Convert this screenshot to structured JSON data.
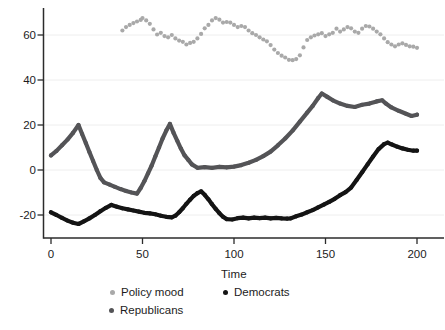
{
  "figure": {
    "background": "#ffffff",
    "text_color": "#1c1c1c",
    "axis_color": "#2b2b2b",
    "gridline_color": "#eeeeee"
  },
  "chart_data": {
    "type": "scatter",
    "title": "",
    "xlabel": "Time",
    "ylabel": "",
    "x_ticks": [
      0,
      50,
      100,
      150,
      200
    ],
    "y_ticks": [
      60,
      40,
      20,
      0,
      -20
    ],
    "xlim": [
      0,
      215
    ],
    "ylim": [
      -30,
      72
    ],
    "grid": "faint horizontal lines at each y tick",
    "legend_position": "bottom",
    "legend": [
      {
        "label": "Policy mood",
        "color": "#a9a9a9"
      },
      {
        "label": "Democrats",
        "color": "#141414"
      },
      {
        "label": "Republicans",
        "color": "#545457"
      }
    ],
    "series": [
      {
        "name": "Policy mood",
        "color": "#a9a9a9",
        "style": "dots",
        "points": [
          [
            39,
            62
          ],
          [
            41,
            63.5
          ],
          [
            43,
            64.5
          ],
          [
            45,
            65.3
          ],
          [
            47,
            66
          ],
          [
            49,
            66.7
          ],
          [
            50,
            67.5
          ],
          [
            52,
            66.5
          ],
          [
            54,
            65
          ],
          [
            56,
            62.5
          ],
          [
            58,
            60.2
          ],
          [
            60,
            61
          ],
          [
            62,
            59.5
          ],
          [
            64,
            59
          ],
          [
            66,
            60
          ],
          [
            68,
            58.5
          ],
          [
            70,
            57.5
          ],
          [
            72,
            57
          ],
          [
            74,
            55.8
          ],
          [
            76,
            56.5
          ],
          [
            78,
            57
          ],
          [
            80,
            58.5
          ],
          [
            82,
            60.5
          ],
          [
            84,
            63
          ],
          [
            86,
            64.5
          ],
          [
            88,
            66.5
          ],
          [
            90,
            67.5
          ],
          [
            92,
            66.8
          ],
          [
            94,
            65.5
          ],
          [
            96,
            65.8
          ],
          [
            98,
            65.5
          ],
          [
            100,
            64.5
          ],
          [
            102,
            63.5
          ],
          [
            104,
            64
          ],
          [
            106,
            63.5
          ],
          [
            108,
            62
          ],
          [
            110,
            60.8
          ],
          [
            112,
            60
          ],
          [
            114,
            59
          ],
          [
            116,
            58
          ],
          [
            118,
            57.2
          ],
          [
            120,
            55.5
          ],
          [
            122,
            53.5
          ],
          [
            124,
            52
          ],
          [
            126,
            50.8
          ],
          [
            128,
            50
          ],
          [
            130,
            49
          ],
          [
            132,
            48.8
          ],
          [
            134,
            49.3
          ],
          [
            136,
            51
          ],
          [
            138,
            54.5
          ],
          [
            140,
            57.8
          ],
          [
            142,
            59
          ],
          [
            144,
            59.8
          ],
          [
            146,
            60.3
          ],
          [
            148,
            60.8
          ],
          [
            150,
            59.5
          ],
          [
            152,
            60.3
          ],
          [
            154,
            61
          ],
          [
            156,
            62.8
          ],
          [
            158,
            61.5
          ],
          [
            160,
            62.5
          ],
          [
            162,
            63.5
          ],
          [
            164,
            63
          ],
          [
            166,
            61.5
          ],
          [
            168,
            61
          ],
          [
            170,
            62.8
          ],
          [
            172,
            64
          ],
          [
            174,
            63.8
          ],
          [
            176,
            62.8
          ],
          [
            178,
            61.5
          ],
          [
            180,
            60.3
          ],
          [
            182,
            58.5
          ],
          [
            184,
            56.8
          ],
          [
            186,
            55.8
          ],
          [
            188,
            55
          ],
          [
            190,
            55.8
          ],
          [
            192,
            56.3
          ],
          [
            194,
            55.6
          ],
          [
            196,
            55
          ],
          [
            198,
            54.8
          ],
          [
            200,
            54.3
          ]
        ]
      },
      {
        "name": "Republicans",
        "color": "#545457",
        "style": "dots-line",
        "points": [
          [
            0,
            6.5
          ],
          [
            3,
            8.5
          ],
          [
            6,
            11
          ],
          [
            9,
            13.5
          ],
          [
            12,
            16.5
          ],
          [
            15,
            20
          ],
          [
            17,
            16
          ],
          [
            19,
            12
          ],
          [
            21,
            8
          ],
          [
            23,
            4
          ],
          [
            25,
            0
          ],
          [
            27,
            -3.5
          ],
          [
            29,
            -5.5
          ],
          [
            32,
            -6.5
          ],
          [
            35,
            -7.5
          ],
          [
            38,
            -8.5
          ],
          [
            41,
            -9.3
          ],
          [
            44,
            -10
          ],
          [
            47,
            -10.5
          ],
          [
            49,
            -8
          ],
          [
            51,
            -5
          ],
          [
            53,
            -1.5
          ],
          [
            55,
            2
          ],
          [
            57,
            6
          ],
          [
            59,
            10
          ],
          [
            61,
            14
          ],
          [
            63,
            17.5
          ],
          [
            65,
            20.5
          ],
          [
            67,
            16.5
          ],
          [
            69,
            13
          ],
          [
            71,
            9.5
          ],
          [
            73,
            6.5
          ],
          [
            75,
            4.5
          ],
          [
            77,
            2.5
          ],
          [
            80,
            1
          ],
          [
            84,
            1.3
          ],
          [
            88,
            1
          ],
          [
            92,
            1.4
          ],
          [
            96,
            1.2
          ],
          [
            100,
            1.5
          ],
          [
            104,
            2.2
          ],
          [
            108,
            3.2
          ],
          [
            112,
            4.5
          ],
          [
            116,
            6.2
          ],
          [
            120,
            8.2
          ],
          [
            124,
            11
          ],
          [
            128,
            14
          ],
          [
            132,
            17.5
          ],
          [
            136,
            21.5
          ],
          [
            140,
            25.5
          ],
          [
            143,
            28.5
          ],
          [
            146,
            32
          ],
          [
            148,
            34
          ],
          [
            151,
            32.5
          ],
          [
            154,
            31
          ],
          [
            158,
            29.5
          ],
          [
            162,
            28.5
          ],
          [
            166,
            28
          ],
          [
            170,
            29
          ],
          [
            174,
            29.5
          ],
          [
            178,
            30.5
          ],
          [
            181,
            31
          ],
          [
            183,
            29.5
          ],
          [
            186,
            27.8
          ],
          [
            190,
            26.3
          ],
          [
            194,
            25
          ],
          [
            197,
            24
          ],
          [
            200,
            24.6
          ]
        ]
      },
      {
        "name": "Democrats",
        "color": "#141414",
        "style": "dots-line",
        "points": [
          [
            0,
            -18.8
          ],
          [
            3,
            -20
          ],
          [
            6,
            -21.3
          ],
          [
            9,
            -22.5
          ],
          [
            12,
            -23.4
          ],
          [
            15,
            -24
          ],
          [
            18,
            -22.8
          ],
          [
            21,
            -21.5
          ],
          [
            24,
            -20
          ],
          [
            27,
            -18.3
          ],
          [
            30,
            -16.8
          ],
          [
            33,
            -15.5
          ],
          [
            36,
            -16.3
          ],
          [
            39,
            -17
          ],
          [
            42,
            -17.5
          ],
          [
            45,
            -18
          ],
          [
            48,
            -18.5
          ],
          [
            51,
            -19
          ],
          [
            54,
            -19.3
          ],
          [
            57,
            -19.7
          ],
          [
            60,
            -20.3
          ],
          [
            63,
            -20.8
          ],
          [
            66,
            -21
          ],
          [
            68,
            -20.3
          ],
          [
            70,
            -18.8
          ],
          [
            72,
            -17
          ],
          [
            74,
            -15
          ],
          [
            76,
            -13.2
          ],
          [
            78,
            -11.5
          ],
          [
            80,
            -10.3
          ],
          [
            82,
            -9.5
          ],
          [
            84,
            -11
          ],
          [
            86,
            -13
          ],
          [
            88,
            -15.2
          ],
          [
            90,
            -17.3
          ],
          [
            92,
            -19.2
          ],
          [
            94,
            -20.8
          ],
          [
            96,
            -21.8
          ],
          [
            99,
            -22
          ],
          [
            102,
            -21.4
          ],
          [
            105,
            -21.2
          ],
          [
            108,
            -21.5
          ],
          [
            111,
            -21.2
          ],
          [
            114,
            -21.4
          ],
          [
            117,
            -21.2
          ],
          [
            120,
            -21.5
          ],
          [
            123,
            -21.3
          ],
          [
            126,
            -21.5
          ],
          [
            129,
            -21.6
          ],
          [
            131,
            -21.5
          ],
          [
            134,
            -20.6
          ],
          [
            137,
            -19.8
          ],
          [
            140,
            -18.8
          ],
          [
            143,
            -17.8
          ],
          [
            146,
            -16.6
          ],
          [
            149,
            -15.4
          ],
          [
            152,
            -14.2
          ],
          [
            155,
            -12.8
          ],
          [
            158,
            -11.2
          ],
          [
            161,
            -9.8
          ],
          [
            164,
            -7.8
          ],
          [
            167,
            -4.5
          ],
          [
            170,
            -1
          ],
          [
            173,
            2.5
          ],
          [
            176,
            6
          ],
          [
            179,
            9.3
          ],
          [
            182,
            11.5
          ],
          [
            184,
            12.2
          ],
          [
            186,
            11.4
          ],
          [
            189,
            10.4
          ],
          [
            192,
            9.6
          ],
          [
            195,
            9
          ],
          [
            198,
            8.6
          ],
          [
            200,
            8.6
          ]
        ]
      }
    ]
  }
}
